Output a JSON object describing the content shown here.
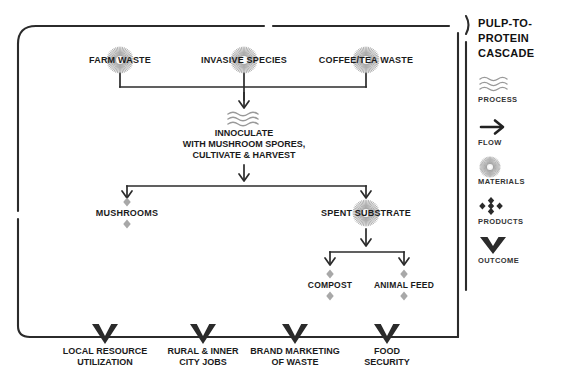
{
  "legend": {
    "title_line1": "PULP-TO-PROTEIN",
    "title_line2": "CASCADE",
    "items": [
      {
        "icon": "waves-icon",
        "label": "PROCESS"
      },
      {
        "icon": "arrow-right-icon",
        "label": "FLOW"
      },
      {
        "icon": "sunburst-circle-icon",
        "label": "MATERIALS"
      },
      {
        "icon": "diamond-cluster-icon",
        "label": "PRODUCTS"
      },
      {
        "icon": "chevron-down-icon",
        "label": "OUTCOME"
      }
    ]
  },
  "diagram": {
    "sources": [
      {
        "label": "FARM WASTE",
        "x": 120,
        "y": 60
      },
      {
        "label": "INVASIVE SPECIES",
        "x": 244,
        "y": 60
      },
      {
        "label": "COFFEE/TEA WASTE",
        "x": 366,
        "y": 60
      }
    ],
    "process": {
      "line1": "INNOCULATE",
      "line2": "WITH MUSHROOM SPORES,",
      "line3": "CULTIVATE & HARVEST",
      "x": 244,
      "y": 128
    },
    "stage2": [
      {
        "label": "MUSHROOMS",
        "x": 127,
        "y": 213,
        "marker": "products"
      },
      {
        "label": "SPENT SUBSTRATE",
        "x": 366,
        "y": 213,
        "marker": "materials"
      }
    ],
    "stage3": [
      {
        "label": "COMPOST",
        "x": 330,
        "y": 285,
        "marker": "products"
      },
      {
        "label": "ANIMAL FEED",
        "x": 404,
        "y": 285,
        "marker": "products"
      }
    ],
    "outcomes": [
      {
        "line1": "LOCAL RESOURCE",
        "line2": "UTILIZATION",
        "x": 105
      },
      {
        "line1": "RURAL & INNER",
        "line2": "CITY JOBS",
        "x": 203
      },
      {
        "line1": "BRAND MARKETING",
        "line2": "OF WASTE",
        "x": 295
      },
      {
        "line1": "FOOD",
        "line2": "SECURITY",
        "x": 387
      }
    ]
  },
  "colors": {
    "ink": "#1b1b1b",
    "line": "#2b2b2b",
    "marker_gray": "#a8a8a8",
    "circle_gray": "#9a9a9a",
    "wave_gray": "#9a9a9a"
  }
}
